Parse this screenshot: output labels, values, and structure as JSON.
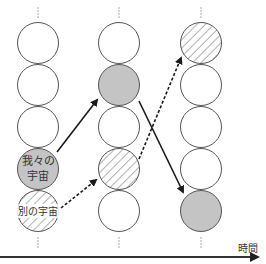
{
  "diagram": {
    "type": "multiverse-timeline",
    "axis": {
      "label": "時間",
      "direction": "right"
    },
    "columns": [
      {
        "id": "t1",
        "x": 38,
        "circles": [
          {
            "row": 0,
            "fill": "empty",
            "label": ""
          },
          {
            "row": 1,
            "fill": "empty",
            "label": ""
          },
          {
            "row": 2,
            "fill": "empty",
            "label": ""
          },
          {
            "row": 3,
            "fill": "gray",
            "label_line1": "我々の",
            "label_line2": "宇宙"
          },
          {
            "row": 4,
            "fill": "hatched",
            "label": "別の宇宙"
          }
        ]
      },
      {
        "id": "t2",
        "x": 119,
        "circles": [
          {
            "row": 0,
            "fill": "empty"
          },
          {
            "row": 1,
            "fill": "gray"
          },
          {
            "row": 2,
            "fill": "empty"
          },
          {
            "row": 3,
            "fill": "hatched"
          },
          {
            "row": 4,
            "fill": "empty"
          }
        ]
      },
      {
        "id": "t3",
        "x": 201,
        "circles": [
          {
            "row": 0,
            "fill": "hatched"
          },
          {
            "row": 1,
            "fill": "empty"
          },
          {
            "row": 2,
            "fill": "empty"
          },
          {
            "row": 3,
            "fill": "empty"
          },
          {
            "row": 4,
            "fill": "gray"
          }
        ]
      }
    ],
    "arrows": [
      {
        "from": "t1.row3 (我々の宇宙)",
        "to": "t2.row1 (gray)",
        "style": "solid"
      },
      {
        "from": "t1.row4 (別の宇宙)",
        "to": "t2.row3 (hatched)",
        "style": "dashed"
      },
      {
        "from": "t2.row1 (gray)",
        "to": "t3.row4 (gray)",
        "style": "solid"
      },
      {
        "from": "t2.row3 (hatched)",
        "to": "t3.row0 (hatched)",
        "style": "dashed"
      }
    ],
    "labels": {
      "our_universe_line1": "我々の",
      "our_universe_line2": "宇宙",
      "other_universe": "別の宇宙",
      "time": "時間"
    },
    "colors": {
      "stroke": "#555555",
      "gray_fill": "#c4c4c4",
      "hatch": "#666666",
      "arrow": "#1a1a1a",
      "axis": "#333333"
    }
  }
}
